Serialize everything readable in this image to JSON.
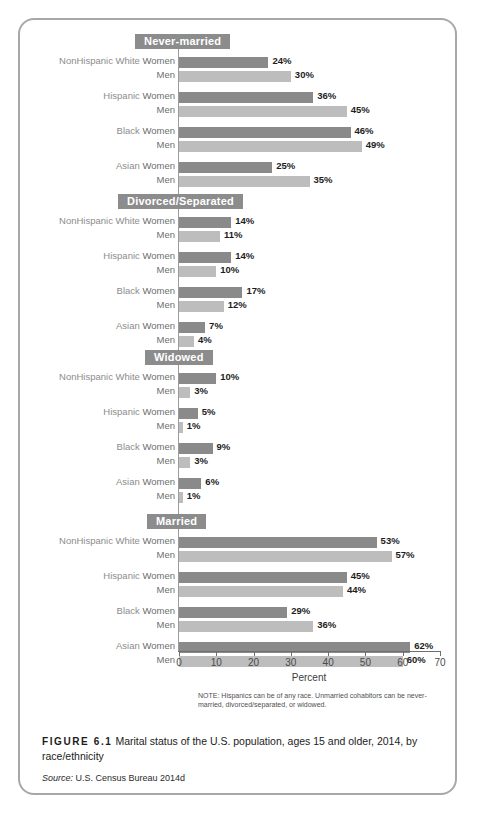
{
  "figure": {
    "number_label": "FIGURE 6.1",
    "caption": "Marital status of the U.S. population, ages 15 and older, 2014, by race/ethnicity",
    "source_label": "Source:",
    "source_text": "U.S. Census Bureau 2014d",
    "note": "NOTE: Hispanics can be of any race. Unmarried cohabitors can be never-married, divorced/separated, or widowed."
  },
  "colors": {
    "women_bar": "#8a8a8a",
    "men_bar": "#bdbdbd",
    "badge": "#8c8c8c",
    "axis": "#6f6f6f",
    "border": "#a8a8a8"
  },
  "chart_data": {
    "type": "bar",
    "title": "Marital status of the U.S. population, ages 15 and older, 2014, by race/ethnicity",
    "xlabel": "Percent",
    "ylabel": "",
    "xlim": [
      0,
      70
    ],
    "xticks": [
      0,
      10,
      20,
      30,
      40,
      50,
      60,
      70
    ],
    "xtick_labels": [
      "0",
      "10",
      "20",
      "30",
      "40",
      "50",
      "60",
      "70"
    ],
    "grid": false,
    "legend": [
      {
        "name": "Women",
        "color": "#8a8a8a"
      },
      {
        "name": "Men",
        "color": "#bdbdbd"
      }
    ],
    "value_suffix": "%",
    "categories": [
      "NonHispanic White",
      "Hispanic",
      "Black",
      "Asian"
    ],
    "groups": [
      {
        "label": "Never-married",
        "rows": [
          {
            "category": "NonHispanic White",
            "sex": "Women",
            "value": 24,
            "value_label": "24%"
          },
          {
            "category": "",
            "sex": "Men",
            "value": 30,
            "value_label": "30%"
          },
          {
            "category": "Hispanic",
            "sex": "Women",
            "value": 36,
            "value_label": "36%"
          },
          {
            "category": "",
            "sex": "Men",
            "value": 45,
            "value_label": "45%"
          },
          {
            "category": "Black",
            "sex": "Women",
            "value": 46,
            "value_label": "46%"
          },
          {
            "category": "",
            "sex": "Men",
            "value": 49,
            "value_label": "49%"
          },
          {
            "category": "Asian",
            "sex": "Women",
            "value": 25,
            "value_label": "25%"
          },
          {
            "category": "",
            "sex": "Men",
            "value": 35,
            "value_label": "35%"
          }
        ]
      },
      {
        "label": "Divorced/Separated",
        "rows": [
          {
            "category": "NonHispanic White",
            "sex": "Women",
            "value": 14,
            "value_label": "14%"
          },
          {
            "category": "",
            "sex": "Men",
            "value": 11,
            "value_label": "11%"
          },
          {
            "category": "Hispanic",
            "sex": "Women",
            "value": 14,
            "value_label": "14%"
          },
          {
            "category": "",
            "sex": "Men",
            "value": 10,
            "value_label": "10%"
          },
          {
            "category": "Black",
            "sex": "Women",
            "value": 17,
            "value_label": "17%"
          },
          {
            "category": "",
            "sex": "Men",
            "value": 12,
            "value_label": "12%"
          },
          {
            "category": "Asian",
            "sex": "Women",
            "value": 7,
            "value_label": "7%"
          },
          {
            "category": "",
            "sex": "Men",
            "value": 4,
            "value_label": "4%"
          }
        ]
      },
      {
        "label": "Widowed",
        "rows": [
          {
            "category": "NonHispanic White",
            "sex": "Women",
            "value": 10,
            "value_label": "10%"
          },
          {
            "category": "",
            "sex": "Men",
            "value": 3,
            "value_label": "3%"
          },
          {
            "category": "Hispanic",
            "sex": "Women",
            "value": 5,
            "value_label": "5%"
          },
          {
            "category": "",
            "sex": "Men",
            "value": 1,
            "value_label": "1%"
          },
          {
            "category": "Black",
            "sex": "Women",
            "value": 9,
            "value_label": "9%"
          },
          {
            "category": "",
            "sex": "Men",
            "value": 3,
            "value_label": "3%"
          },
          {
            "category": "Asian",
            "sex": "Women",
            "value": 6,
            "value_label": "6%"
          },
          {
            "category": "",
            "sex": "Men",
            "value": 1,
            "value_label": "1%"
          }
        ]
      },
      {
        "label": "Married",
        "rows": [
          {
            "category": "NonHispanic White",
            "sex": "Women",
            "value": 53,
            "value_label": "53%"
          },
          {
            "category": "",
            "sex": "Men",
            "value": 57,
            "value_label": "57%"
          },
          {
            "category": "Hispanic",
            "sex": "Women",
            "value": 45,
            "value_label": "45%"
          },
          {
            "category": "",
            "sex": "Men",
            "value": 44,
            "value_label": "44%"
          },
          {
            "category": "Black",
            "sex": "Women",
            "value": 29,
            "value_label": "29%"
          },
          {
            "category": "",
            "sex": "Men",
            "value": 36,
            "value_label": "36%"
          },
          {
            "category": "Asian",
            "sex": "Women",
            "value": 62,
            "value_label": "62%"
          },
          {
            "category": "",
            "sex": "Men",
            "value": 60,
            "value_label": "60%"
          }
        ]
      }
    ]
  }
}
